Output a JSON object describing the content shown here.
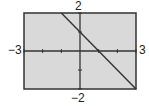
{
  "chart_data": {
    "type": "line",
    "title": "",
    "xlabel": "",
    "ylabel": "",
    "xlim": [
      -3,
      3
    ],
    "ylim": [
      -2,
      2
    ],
    "xticks": [
      -3,
      -2,
      -1,
      0,
      1,
      2,
      3
    ],
    "yticks": [
      -2,
      -1,
      0,
      1,
      2
    ],
    "grid": false,
    "legend": null,
    "series": [
      {
        "name": "y = -x + 1",
        "x": [
          -1,
          3
        ],
        "y": [
          2,
          -2
        ]
      }
    ],
    "window_labels": {
      "xmin": "−3",
      "xmax": "3",
      "ymin": "−2",
      "ymax": "2"
    },
    "colors": {
      "background": "#d9d9d9",
      "frame": "#333333",
      "line": "#333333"
    }
  }
}
